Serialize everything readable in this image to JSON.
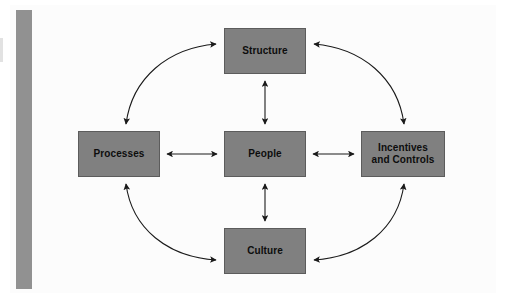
{
  "figure": {
    "name": "organization-design-star-diagram",
    "background_color": "#ffffff",
    "panel_color": "#fcfcfc",
    "sidebar_color": "#919191",
    "node_fill_color": "#808080",
    "node_border_color": "#5c5c5c",
    "node_text_color": "#0d0d0d",
    "connector_color": "#1a1a1a"
  },
  "nodes": [
    {
      "id": "structure",
      "label": "Structure"
    },
    {
      "id": "processes",
      "label": "Processes"
    },
    {
      "id": "people",
      "label": "People"
    },
    {
      "id": "incentives",
      "label": "Incentives\nand Controls"
    },
    {
      "id": "culture",
      "label": "Culture"
    }
  ],
  "connectors": {
    "straight": [
      {
        "id": "processes-people",
        "from": "Processes",
        "to": "People",
        "style": "double-headed-arrow",
        "orientation": "horizontal"
      },
      {
        "id": "people-incentives",
        "from": "People",
        "to": "Incentives and Controls",
        "style": "double-headed-arrow",
        "orientation": "horizontal"
      },
      {
        "id": "structure-people",
        "from": "Structure",
        "to": "People",
        "style": "double-headed-arrow",
        "orientation": "vertical"
      },
      {
        "id": "people-culture",
        "from": "People",
        "to": "Culture",
        "style": "double-headed-arrow",
        "orientation": "vertical"
      }
    ],
    "curved": [
      {
        "id": "processes-structure",
        "from": "Processes",
        "to": "Structure",
        "style": "double-headed-curve",
        "quadrant": "upper-left"
      },
      {
        "id": "structure-incentives",
        "from": "Structure",
        "to": "Incentives and Controls",
        "style": "double-headed-curve",
        "quadrant": "upper-right"
      },
      {
        "id": "processes-culture",
        "from": "Processes",
        "to": "Culture",
        "style": "double-headed-curve",
        "quadrant": "lower-left"
      },
      {
        "id": "culture-incentives",
        "from": "Culture",
        "to": "Incentives and Controls",
        "style": "double-headed-curve",
        "quadrant": "lower-right"
      }
    ]
  }
}
